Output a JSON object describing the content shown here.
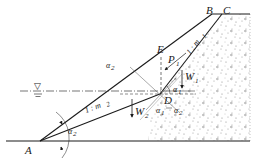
{
  "figure": {
    "type": "slope stability diagram",
    "points": {
      "A": "A",
      "B": "B",
      "C": "C",
      "D": "D",
      "E": "E"
    },
    "slopes": {
      "upper": {
        "prefix": "1 : ",
        "var": "m",
        "sub": "1"
      },
      "lower": {
        "prefix": "1 : ",
        "var": "m",
        "sub": "2"
      }
    },
    "forces": {
      "P1": {
        "var": "P",
        "sub": "1"
      },
      "W1": {
        "var": "W",
        "sub": "1"
      },
      "W2": {
        "var": "W",
        "sub": "2"
      }
    },
    "angles": {
      "alpha1_top": {
        "var": "α",
        "sub": "1"
      },
      "alpha1_bottom": {
        "var": "α",
        "sub": "1"
      },
      "alpha2_bottom": {
        "var": "α",
        "sub": "2"
      },
      "alpha2_left": {
        "var": "α",
        "sub": "2"
      },
      "alpha2_A": {
        "var": "α",
        "sub": "2"
      }
    },
    "water_symbol": "▽",
    "colors": {
      "line": "#1a1a1a",
      "stipple": "#9a9a9a",
      "background": "#ffffff"
    }
  }
}
